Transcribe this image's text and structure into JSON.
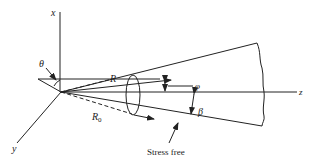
{
  "diagram": {
    "type": "cone-coordinate-geometry",
    "colors": {
      "ink": "#222222",
      "background": "#ffffff"
    },
    "axes": {
      "x": {
        "label": "x"
      },
      "y": {
        "label": "y"
      },
      "z": {
        "label": "z"
      }
    },
    "labels": {
      "theta": "θ",
      "R": "R",
      "R0_main": "R",
      "R0_sub": "0",
      "phi": "φ",
      "beta": "β",
      "stress_free": "Stress free"
    }
  }
}
